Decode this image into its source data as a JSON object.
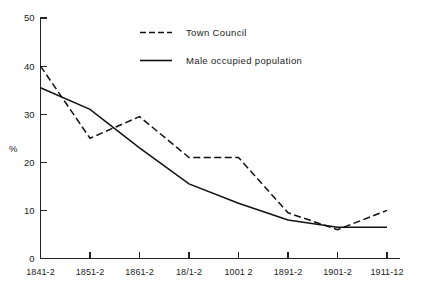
{
  "chart_data": {
    "type": "line",
    "title": "",
    "xlabel": "",
    "ylabel": "%",
    "ylim": [
      0,
      50
    ],
    "yticks": [
      0,
      10,
      20,
      30,
      40,
      50
    ],
    "grid": false,
    "legend_position": "top-center",
    "categories": [
      "1841-2",
      "1851-2",
      "1861-2",
      "18/1-2",
      "1001 2",
      "1891-2",
      "1901-2",
      "1911-12"
    ],
    "series": [
      {
        "name": "Town Council",
        "style": "dashed",
        "color": "#111111",
        "values": [
          40,
          25,
          29.5,
          21,
          21,
          9.5,
          6,
          10
        ]
      },
      {
        "name": "Male occupied population",
        "style": "solid",
        "color": "#111111",
        "values": [
          35.5,
          31,
          23,
          15.5,
          11.5,
          8,
          6.5,
          6.5
        ]
      }
    ]
  },
  "legend": {
    "items": [
      {
        "label": "Town Council",
        "style": "dashed"
      },
      {
        "label": "Male occupied population",
        "style": "solid"
      }
    ]
  },
  "axes": {
    "y_axis_title": "%",
    "y_tick_labels": [
      "50",
      "40",
      "30",
      "20",
      "10",
      "0"
    ],
    "x_tick_labels": [
      "1841-2",
      "1851-2",
      "1861-2",
      "18/1-2",
      "1001 2",
      "1891-2",
      "1901-2",
      "1911-12"
    ]
  }
}
